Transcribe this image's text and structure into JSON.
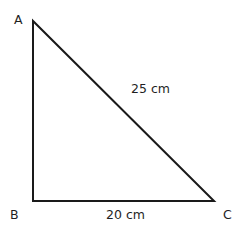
{
  "figure": {
    "kind": "right-triangle-diagram",
    "background_color": "#ffffff",
    "stroke_color": "#1a1a1a",
    "stroke_width": 2,
    "text_color": "#1f1f1f",
    "width": 241,
    "height": 231,
    "vertices": [
      {
        "name": "A",
        "label": "A",
        "x": 33,
        "y": 21
      },
      {
        "name": "B",
        "label": "B",
        "x": 33,
        "y": 201
      },
      {
        "name": "C",
        "label": "C",
        "x": 214,
        "y": 201
      }
    ],
    "sides": [
      {
        "name": "hypotenuse",
        "from": "A",
        "to": "C",
        "label": "25 cm"
      },
      {
        "name": "base",
        "from": "B",
        "to": "C",
        "label": "20 cm"
      },
      {
        "name": "vertical",
        "from": "A",
        "to": "B",
        "label": ""
      }
    ],
    "labels": {
      "vertex_a": "A",
      "vertex_b": "B",
      "vertex_c": "C",
      "hypotenuse_length": "25 cm",
      "base_length": "20 cm"
    }
  }
}
